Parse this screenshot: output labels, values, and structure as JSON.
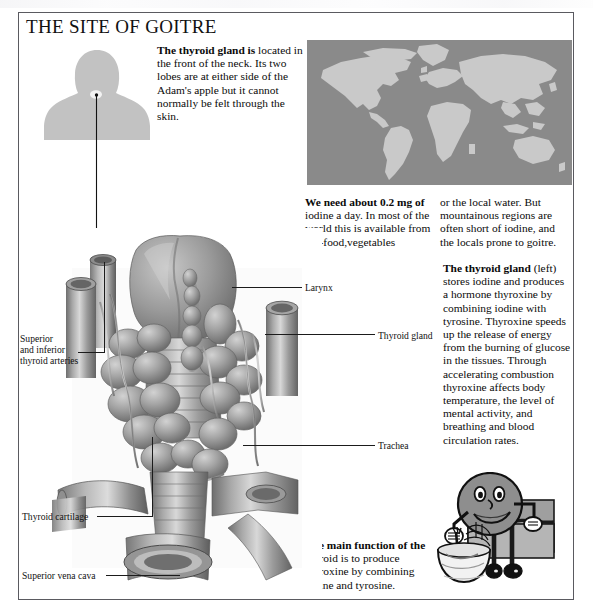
{
  "page": {
    "title": "THE SITE OF GOITRE"
  },
  "text_blocks": {
    "intro": {
      "lead": "The thyroid gland is",
      "body": " located in the front of the neck. Its two lobes are at either side of the Adam's apple but it cannot normally be felt through the skin."
    },
    "iodine_col1": {
      "lead": "We need about 0.2 mg of",
      "body": " iodine a day. In most of the world this is available from sea-food,vegetables"
    },
    "iodine_col2": {
      "lead": "",
      "body": "or the local water. But mountainous regions are often short of iodine, and the locals prone to goitre."
    },
    "thyroid_function": {
      "lead": "The thyroid gland",
      "body": " (left) stores iodine and produces a hormone thyroxine by combining iodine with tyrosine. Thyroxine speeds up the release of energy from the burning of glucose in the tissues. Through accelerating combustion thyroxine affects body temperature, the level of mental activity, and breathing and blood circulation rates."
    },
    "main_function": {
      "lead": "The main function of the",
      "body": " thyroid is to produce thyroxine by combining iodine and tyrosine."
    }
  },
  "labels": {
    "larynx": "Larynx",
    "thyroid_gland": "Thyroid gland",
    "trachea": "Trachea",
    "arteries": "Superior\nand inferior\nthyroid arteries",
    "thyroid_cartilage": "Thyroid cartilage",
    "superior_vena_cava": "Superior vena cava"
  },
  "figures": {
    "bust": "head-and-shoulders-silhouette",
    "world_map": "world-map-grayscale",
    "anatomy": "thyroid-goitre-anatomical-illustration",
    "cartoon": "cartoon-character-eating-from-bowl"
  },
  "colors": {
    "frame": "#5a5a60",
    "bust_fill": "#c2c2c2",
    "map_ocean": "#8a8a8a",
    "map_land": "#c9c9c9",
    "cartoon_fill": "#8e8e8e",
    "text": "#0a0a0a"
  }
}
